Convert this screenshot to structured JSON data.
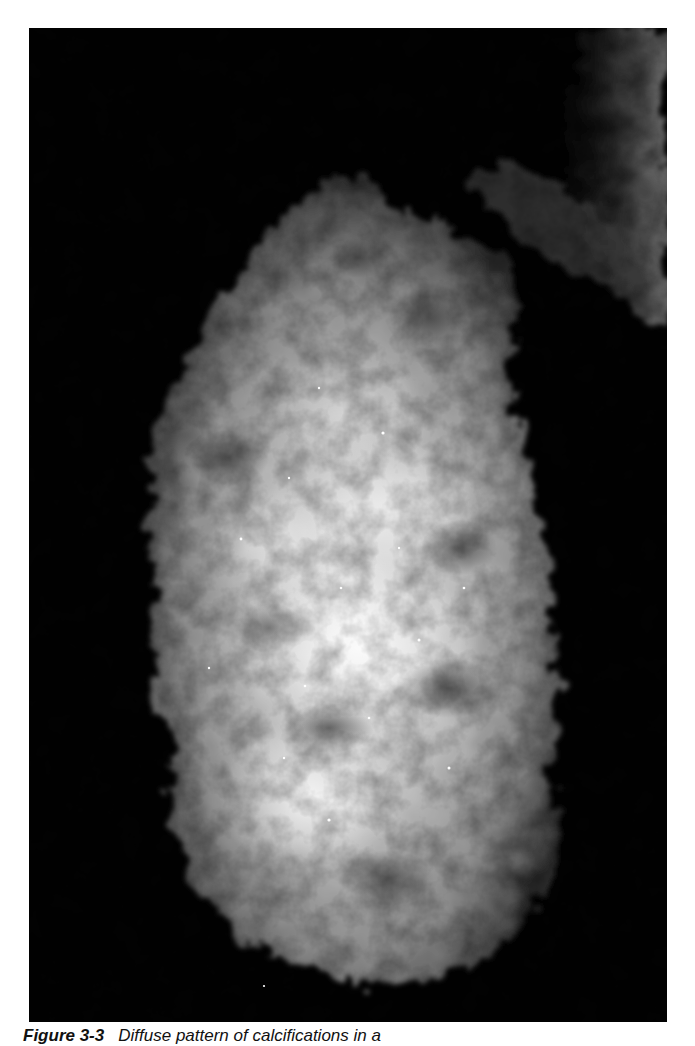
{
  "figure": {
    "image_kind": "mammogram",
    "image_description": "Grayscale craniocaudal mammogram showing dense breast tissue with scattered fine bright calcifications throughout",
    "colors": {
      "background": "#020202",
      "tissue_dark": "#3a3a3a",
      "tissue_mid": "#8c8c8c",
      "tissue_bright": "#e6e6e6",
      "page": "#ffffff",
      "caption_text": "#111111"
    },
    "caption": {
      "label": "Figure 3-3",
      "text": "Diffuse pattern of calcifications in a"
    }
  }
}
